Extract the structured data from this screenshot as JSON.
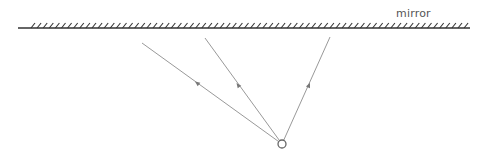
{
  "diagram": {
    "title": "",
    "mirror": {
      "label": "mirror",
      "label_pos": [
        396,
        7
      ],
      "x_start": 18,
      "x_end": 470,
      "y": 28,
      "hatch_start": 31,
      "hatch_end": 466,
      "hatch_spacing": 6.1,
      "hatch_height": 5,
      "hatch_dx": 4,
      "color": "#333333"
    },
    "source": {
      "type": "point-source",
      "x": 282,
      "y": 144,
      "r": 4,
      "stroke": "#666666"
    },
    "rays": [
      {
        "id": "ray-left",
        "from": [
          282,
          144
        ],
        "to": [
          142,
          43
        ],
        "arrow": [
          197,
          83
        ]
      },
      {
        "id": "ray-middle",
        "from": [
          282,
          144
        ],
        "to": [
          205,
          38
        ],
        "arrow": [
          238,
          85
        ]
      },
      {
        "id": "ray-right",
        "from": [
          282,
          144
        ],
        "to": [
          330,
          37
        ],
        "arrow": [
          309,
          85
        ]
      }
    ],
    "ray_color": "#999999"
  }
}
